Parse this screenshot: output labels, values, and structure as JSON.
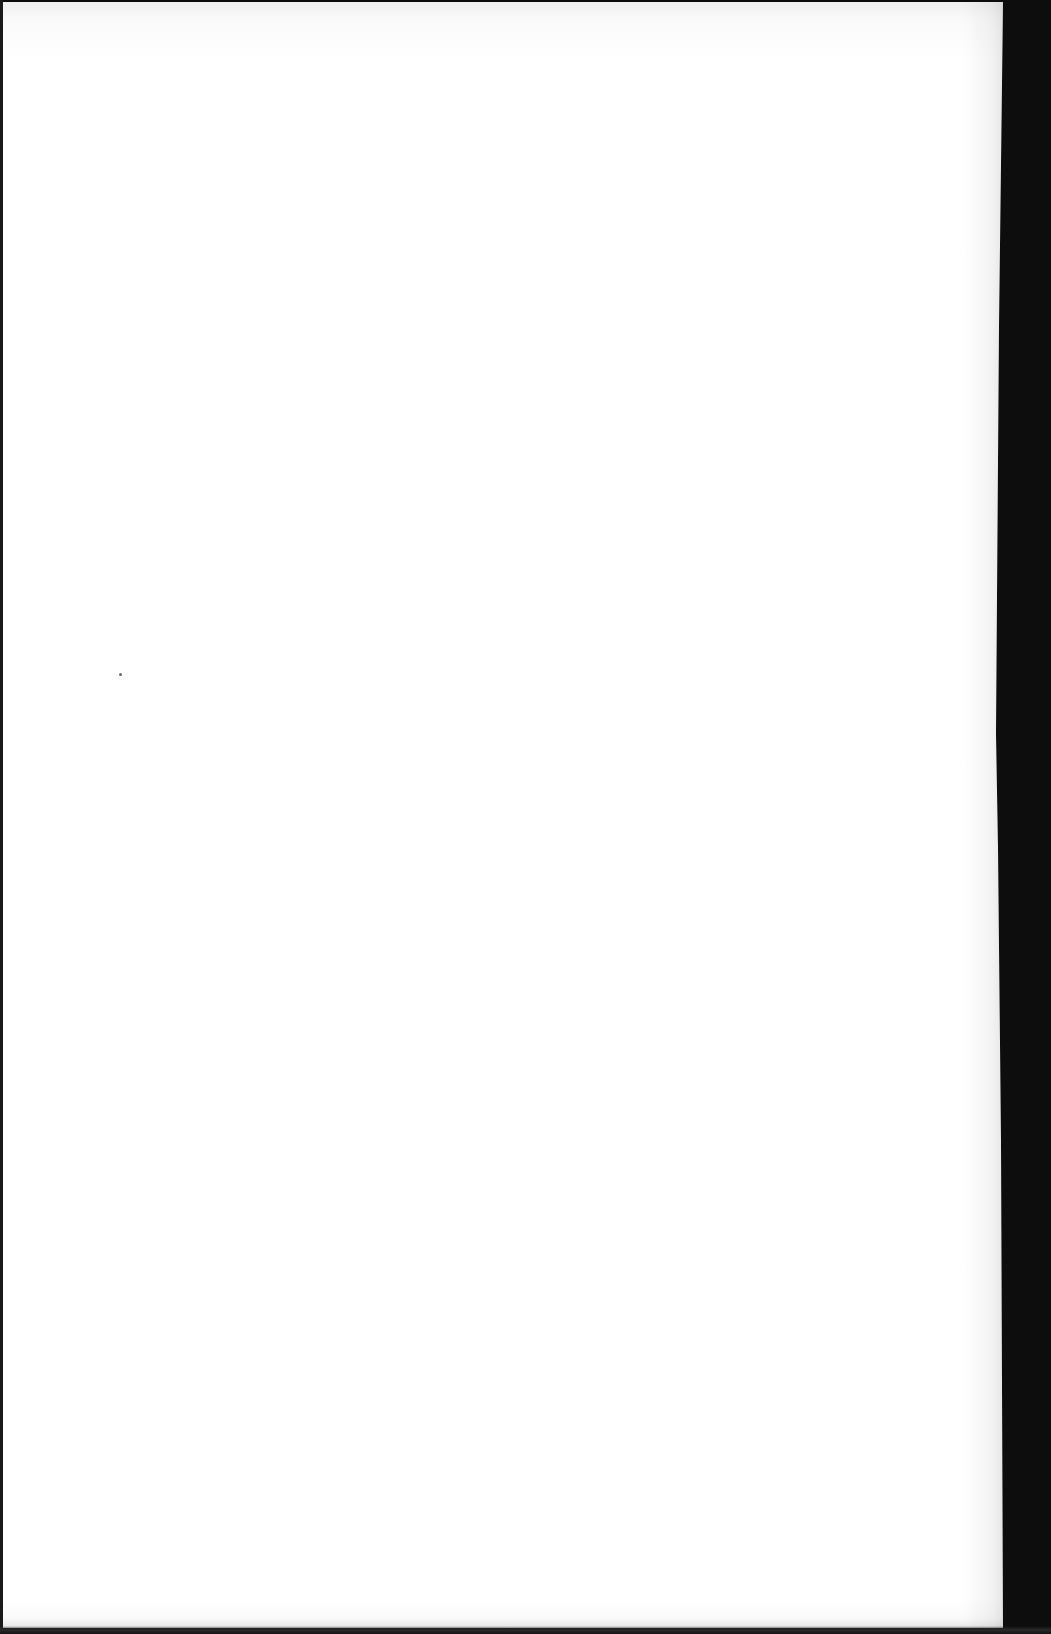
{
  "document": {
    "type": "scanned-page",
    "content": "",
    "background_color": "#ffffff",
    "border_color": "#0d0d0d"
  }
}
